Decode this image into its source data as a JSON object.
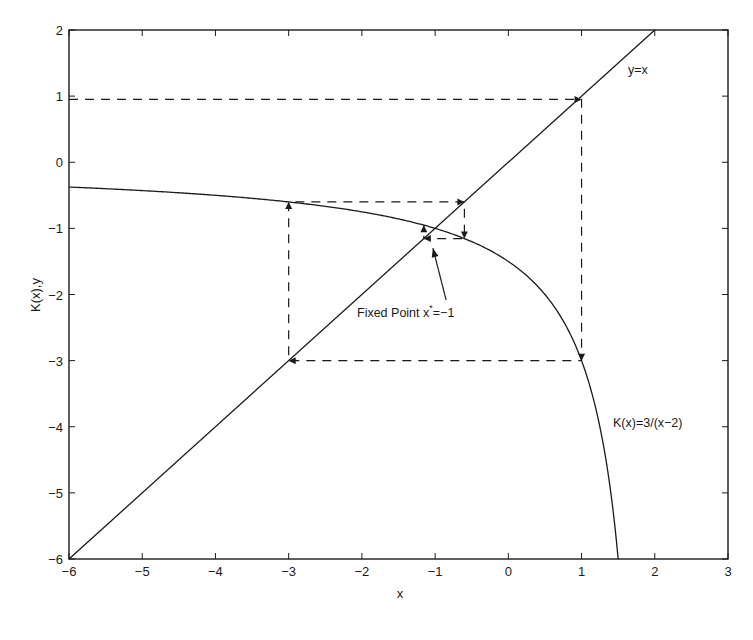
{
  "chart_data": {
    "type": "line",
    "title": "",
    "xlabel": "x",
    "ylabel": "K(x),y",
    "xlim": [
      -6,
      3
    ],
    "ylim": [
      -6,
      2
    ],
    "xticks": [
      -6,
      -5,
      -4,
      -3,
      -2,
      -1,
      0,
      1,
      2,
      3
    ],
    "yticks": [
      -6,
      -5,
      -4,
      -3,
      -2,
      -1,
      0,
      1,
      2
    ],
    "grid": false,
    "legend": null,
    "series": [
      {
        "name": "y=x",
        "style": "solid",
        "function": "y = x",
        "x": [
          -6,
          2
        ],
        "y": [
          -6,
          2
        ]
      },
      {
        "name": "K(x)=3/(x-2)",
        "style": "solid",
        "function": "K(x) = 3/(x-2)",
        "x": [
          -6,
          -5,
          -4,
          -3,
          -2,
          -1,
          -0.6,
          0,
          0.5,
          1,
          1.25,
          1.5
        ],
        "y": [
          -0.375,
          -0.429,
          -0.5,
          -0.6,
          -0.75,
          -1.0,
          -1.154,
          -1.5,
          -2.0,
          -3.0,
          -4.0,
          -6.0
        ]
      },
      {
        "name": "cobweb iteration",
        "style": "dashed",
        "x": [
          -6,
          1,
          1,
          -3,
          -3,
          -0.6,
          -0.6,
          -1.154,
          -1.154
        ],
        "y": [
          0.95,
          0.95,
          -3,
          -3,
          -0.6,
          -0.6,
          -1.154,
          -1.154,
          -0.951
        ]
      }
    ],
    "annotations": [
      {
        "text": "y=x",
        "x": 1.75,
        "y": 1.4
      },
      {
        "text": "K(x)=3/(x−2)",
        "x": 1.4,
        "y": -4.4
      },
      {
        "text_main": "Fixed Point x",
        "text_sup": "*",
        "text_tail": "=−1",
        "x": -2.4,
        "y": -2.5,
        "arrow_from": [
          -0.85,
          -2.08
        ],
        "arrow_to": [
          -1.03,
          -1.3
        ]
      }
    ]
  },
  "labels": {
    "xlabel": "x",
    "ylabel": "K(x),y",
    "line_label": "y=x",
    "curve_label": "K(x)=3/(x−2)",
    "fixed_point_main": "Fixed Point x",
    "fixed_point_sup": "*",
    "fixed_point_tail": "=−1"
  }
}
